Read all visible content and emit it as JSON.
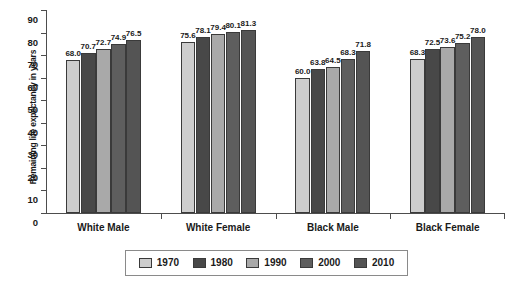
{
  "chart_data": {
    "type": "bar",
    "title": "",
    "xlabel": "",
    "ylabel": "Remaining life expectancy in years",
    "ylim": [
      0,
      90
    ],
    "ytick_step": 10,
    "yticks": [
      0,
      10,
      20,
      30,
      40,
      50,
      60,
      70,
      80,
      90
    ],
    "grid": false,
    "legend_position": "bottom",
    "categories": [
      "White Male",
      "White Female",
      "Black Male",
      "Black Female"
    ],
    "series": [
      {
        "name": "1970",
        "color": "#cdcdcd",
        "values": [
          68.0,
          75.6,
          60.0,
          68.3
        ]
      },
      {
        "name": "1980",
        "color": "#484848",
        "values": [
          70.7,
          78.1,
          63.8,
          72.5
        ]
      },
      {
        "name": "1990",
        "color": "#a9a9a9",
        "values": [
          72.7,
          79.4,
          64.5,
          73.6
        ]
      },
      {
        "name": "2000",
        "color": "#5e5e5e",
        "values": [
          74.9,
          80.1,
          68.3,
          75.2
        ]
      },
      {
        "name": "2010",
        "color": "#545454",
        "values": [
          76.5,
          81.3,
          71.8,
          78.0
        ]
      }
    ],
    "value_labels": [
      [
        "68.0",
        "70.7",
        "72.7",
        "74.9",
        "76.5"
      ],
      [
        "75.6",
        "78.1",
        "79.4",
        "80.1",
        "81.3"
      ],
      [
        "60.0",
        "63.8",
        "64.5",
        "68.3",
        "71.8"
      ],
      [
        "68.3",
        "72.5",
        "73.6",
        "75.2",
        "78.0"
      ]
    ]
  },
  "source_note": ""
}
